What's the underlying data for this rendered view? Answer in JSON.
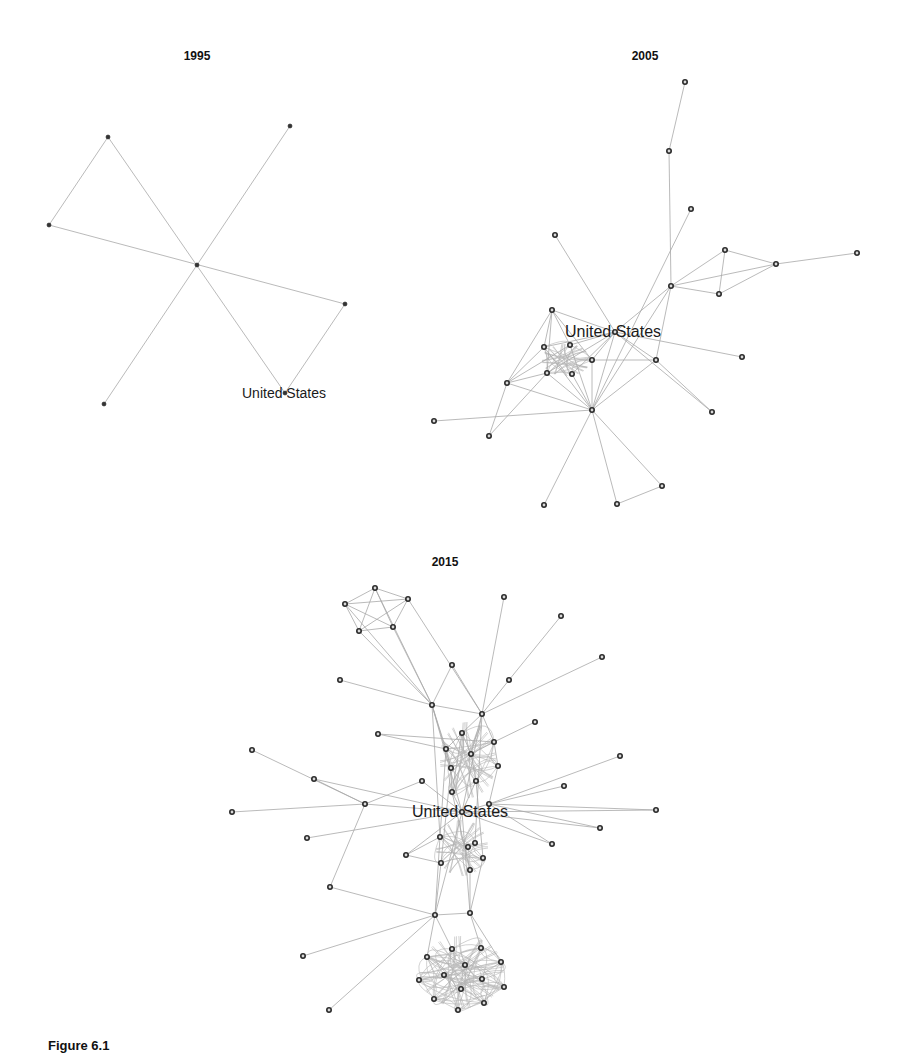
{
  "caption": "Figure 6.1",
  "colors": {
    "edge": "#a8a8a8",
    "node_stroke": "#2a2a2a",
    "text": "#111111"
  },
  "panels": [
    {
      "title": "1995",
      "title_pos": [
        197,
        60
      ],
      "label": "United States",
      "label_node": 5,
      "label_offset": [
        -43,
        5
      ],
      "label_class": "label",
      "node_style": "small",
      "nodes": [
        [
          108,
          137
        ],
        [
          290,
          126
        ],
        [
          49,
          225
        ],
        [
          197,
          265
        ],
        [
          345,
          304
        ],
        [
          285,
          393
        ],
        [
          104,
          404
        ]
      ],
      "edges": [
        [
          0,
          2
        ],
        [
          0,
          5
        ],
        [
          1,
          6
        ],
        [
          2,
          4
        ],
        [
          4,
          5
        ]
      ],
      "dense_blobs": []
    },
    {
      "title": "2005",
      "title_pos": [
        645,
        60
      ],
      "label": "United States",
      "label_node": 10,
      "label_offset": [
        -50,
        5
      ],
      "label_class": "label label-large",
      "node_style": "ring",
      "nodes": [
        [
          685,
          82
        ],
        [
          669,
          151
        ],
        [
          691,
          209
        ],
        [
          555,
          235
        ],
        [
          725,
          250
        ],
        [
          776,
          264
        ],
        [
          857,
          253
        ],
        [
          671,
          286
        ],
        [
          719,
          294
        ],
        [
          552,
          310
        ],
        [
          615,
          332
        ],
        [
          544,
          347
        ],
        [
          570,
          345
        ],
        [
          592,
          360
        ],
        [
          656,
          360
        ],
        [
          742,
          357
        ],
        [
          547,
          373
        ],
        [
          572,
          374
        ],
        [
          507,
          383
        ],
        [
          592,
          410
        ],
        [
          712,
          412
        ],
        [
          434,
          421
        ],
        [
          489,
          436
        ],
        [
          662,
          486
        ],
        [
          544,
          505
        ],
        [
          617,
          504
        ]
      ],
      "edges": [
        [
          0,
          1
        ],
        [
          1,
          7
        ],
        [
          2,
          19
        ],
        [
          3,
          10
        ],
        [
          4,
          5
        ],
        [
          4,
          7
        ],
        [
          4,
          8
        ],
        [
          5,
          6
        ],
        [
          5,
          7
        ],
        [
          5,
          8
        ],
        [
          7,
          8
        ],
        [
          7,
          10
        ],
        [
          7,
          14
        ],
        [
          7,
          19
        ],
        [
          9,
          10
        ],
        [
          9,
          11
        ],
        [
          9,
          12
        ],
        [
          9,
          13
        ],
        [
          9,
          18
        ],
        [
          10,
          11
        ],
        [
          10,
          12
        ],
        [
          10,
          13
        ],
        [
          10,
          14
        ],
        [
          10,
          15
        ],
        [
          10,
          16
        ],
        [
          10,
          17
        ],
        [
          10,
          19
        ],
        [
          10,
          20
        ],
        [
          11,
          18
        ],
        [
          11,
          19
        ],
        [
          13,
          14
        ],
        [
          13,
          19
        ],
        [
          14,
          19
        ],
        [
          14,
          20
        ],
        [
          16,
          18
        ],
        [
          16,
          19
        ],
        [
          17,
          19
        ],
        [
          18,
          22
        ],
        [
          18,
          19
        ],
        [
          12,
          19
        ],
        [
          19,
          21
        ],
        [
          19,
          23
        ],
        [
          19,
          24
        ],
        [
          19,
          25
        ],
        [
          23,
          25
        ],
        [
          16,
          22
        ],
        [
          9,
          16
        ],
        [
          12,
          18
        ]
      ],
      "dense_blobs": [
        {
          "cx": 566,
          "cy": 360,
          "rx": 24,
          "ry": 16,
          "members": [
            11,
            12,
            13,
            16,
            17
          ]
        }
      ]
    },
    {
      "title": "2015",
      "title_pos": [
        445,
        566
      ],
      "label": "United States",
      "label_node": 23,
      "label_offset": [
        -50,
        5
      ],
      "label_class": "label label-large",
      "node_style": "ring",
      "nodes": [
        [
          375,
          588
        ],
        [
          345,
          604
        ],
        [
          408,
          599
        ],
        [
          359,
          631
        ],
        [
          393,
          627
        ],
        [
          504,
          597
        ],
        [
          561,
          616
        ],
        [
          602,
          657
        ],
        [
          452,
          665
        ],
        [
          340,
          680
        ],
        [
          509,
          680
        ],
        [
          432,
          705
        ],
        [
          482,
          714
        ],
        [
          535,
          722
        ],
        [
          462,
          733
        ],
        [
          494,
          742
        ],
        [
          446,
          749
        ],
        [
          471,
          754
        ],
        [
          620,
          756
        ],
        [
          451,
          768
        ],
        [
          498,
          766
        ],
        [
          476,
          781
        ],
        [
          564,
          786
        ],
        [
          462,
          812
        ],
        [
          452,
          792
        ],
        [
          489,
          804
        ],
        [
          656,
          810
        ],
        [
          600,
          828
        ],
        [
          440,
          837
        ],
        [
          475,
          843
        ],
        [
          468,
          847
        ],
        [
          552,
          844
        ],
        [
          483,
          858
        ],
        [
          441,
          863
        ],
        [
          470,
          870
        ],
        [
          378,
          734
        ],
        [
          252,
          750
        ],
        [
          314,
          779
        ],
        [
          422,
          781
        ],
        [
          232,
          812
        ],
        [
          365,
          804
        ],
        [
          307,
          838
        ],
        [
          406,
          855
        ],
        [
          330,
          887
        ],
        [
          435,
          915
        ],
        [
          470,
          913
        ],
        [
          303,
          956
        ],
        [
          452,
          949
        ],
        [
          481,
          948
        ],
        [
          427,
          957
        ],
        [
          501,
          962
        ],
        [
          465,
          965
        ],
        [
          444,
          975
        ],
        [
          482,
          979
        ],
        [
          419,
          980
        ],
        [
          504,
          987
        ],
        [
          461,
          989
        ],
        [
          434,
          999
        ],
        [
          484,
          1003
        ],
        [
          458,
          1010
        ],
        [
          329,
          1010
        ]
      ],
      "edges": [
        [
          0,
          1
        ],
        [
          0,
          2
        ],
        [
          0,
          3
        ],
        [
          0,
          4
        ],
        [
          1,
          2
        ],
        [
          1,
          3
        ],
        [
          1,
          4
        ],
        [
          2,
          3
        ],
        [
          2,
          4
        ],
        [
          3,
          4
        ],
        [
          1,
          11
        ],
        [
          3,
          11
        ],
        [
          4,
          11
        ],
        [
          2,
          12
        ],
        [
          0,
          11
        ],
        [
          5,
          12
        ],
        [
          6,
          10
        ],
        [
          7,
          12
        ],
        [
          8,
          11
        ],
        [
          8,
          12
        ],
        [
          9,
          11
        ],
        [
          10,
          12
        ],
        [
          11,
          12
        ],
        [
          11,
          16
        ],
        [
          11,
          19
        ],
        [
          11,
          23
        ],
        [
          12,
          14
        ],
        [
          12,
          15
        ],
        [
          12,
          17
        ],
        [
          12,
          23
        ],
        [
          13,
          15
        ],
        [
          14,
          16
        ],
        [
          14,
          17
        ],
        [
          15,
          17
        ],
        [
          15,
          20
        ],
        [
          16,
          19
        ],
        [
          17,
          21
        ],
        [
          18,
          25
        ],
        [
          19,
          24
        ],
        [
          20,
          25
        ],
        [
          21,
          23
        ],
        [
          22,
          25
        ],
        [
          23,
          24
        ],
        [
          23,
          25
        ],
        [
          23,
          26
        ],
        [
          23,
          27
        ],
        [
          23,
          31
        ],
        [
          25,
          26
        ],
        [
          25,
          27
        ],
        [
          25,
          31
        ],
        [
          35,
          15
        ],
        [
          35,
          16
        ],
        [
          36,
          40
        ],
        [
          37,
          40
        ],
        [
          37,
          23
        ],
        [
          38,
          23
        ],
        [
          38,
          40
        ],
        [
          39,
          40
        ],
        [
          40,
          23
        ],
        [
          40,
          43
        ],
        [
          41,
          23
        ],
        [
          42,
          28
        ],
        [
          42,
          33
        ],
        [
          42,
          23
        ],
        [
          43,
          44
        ],
        [
          44,
          45
        ],
        [
          44,
          46
        ],
        [
          44,
          60
        ],
        [
          44,
          47
        ],
        [
          44,
          49
        ],
        [
          45,
          48
        ],
        [
          45,
          50
        ],
        [
          28,
          44
        ],
        [
          33,
          44
        ],
        [
          34,
          45
        ],
        [
          32,
          45
        ],
        [
          23,
          44
        ],
        [
          23,
          45
        ],
        [
          11,
          28
        ],
        [
          12,
          29
        ],
        [
          16,
          28
        ],
        [
          19,
          33
        ],
        [
          21,
          32
        ],
        [
          24,
          34
        ],
        [
          14,
          24
        ]
      ],
      "dense_blobs": [
        {
          "cx": 468,
          "cy": 760,
          "rx": 28,
          "ry": 38,
          "members": [
            14,
            15,
            16,
            17,
            19,
            20,
            21,
            24
          ]
        },
        {
          "cx": 462,
          "cy": 848,
          "rx": 26,
          "ry": 28,
          "members": [
            28,
            29,
            30,
            32,
            33,
            34
          ]
        },
        {
          "cx": 462,
          "cy": 972,
          "rx": 42,
          "ry": 36,
          "members": [
            47,
            48,
            49,
            50,
            51,
            52,
            53,
            54,
            55,
            56,
            57,
            58,
            59
          ]
        }
      ]
    }
  ]
}
